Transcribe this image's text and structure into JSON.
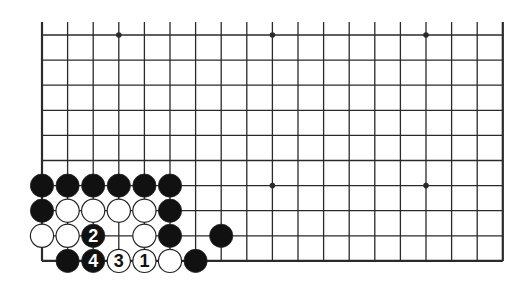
{
  "diagram": {
    "type": "go-board-section",
    "columns": 19,
    "visible_rows": 10,
    "open_top_edge": true,
    "grid": {
      "x0": 42,
      "dx": 25.6,
      "y0": 35,
      "dy": 25.1,
      "top_extend": 13
    },
    "hoshi": [
      [
        3,
        0
      ],
      [
        9,
        0
      ],
      [
        15,
        0
      ],
      [
        3,
        6
      ],
      [
        9,
        6
      ],
      [
        15,
        6
      ]
    ],
    "stones": [
      {
        "col": 0,
        "row": 6,
        "color": "black"
      },
      {
        "col": 1,
        "row": 6,
        "color": "black"
      },
      {
        "col": 2,
        "row": 6,
        "color": "black"
      },
      {
        "col": 3,
        "row": 6,
        "color": "black"
      },
      {
        "col": 4,
        "row": 6,
        "color": "black"
      },
      {
        "col": 5,
        "row": 6,
        "color": "black"
      },
      {
        "col": 0,
        "row": 7,
        "color": "black"
      },
      {
        "col": 1,
        "row": 7,
        "color": "white"
      },
      {
        "col": 2,
        "row": 7,
        "color": "white"
      },
      {
        "col": 3,
        "row": 7,
        "color": "white"
      },
      {
        "col": 4,
        "row": 7,
        "color": "white"
      },
      {
        "col": 5,
        "row": 7,
        "color": "black"
      },
      {
        "col": 0,
        "row": 8,
        "color": "white"
      },
      {
        "col": 1,
        "row": 8,
        "color": "white"
      },
      {
        "col": 2,
        "row": 8,
        "color": "black",
        "label": "2"
      },
      {
        "col": 4,
        "row": 8,
        "color": "white"
      },
      {
        "col": 5,
        "row": 8,
        "color": "black"
      },
      {
        "col": 7,
        "row": 8,
        "color": "black"
      },
      {
        "col": 1,
        "row": 9,
        "color": "black"
      },
      {
        "col": 2,
        "row": 9,
        "color": "black",
        "label": "4"
      },
      {
        "col": 3,
        "row": 9,
        "color": "white",
        "label": "3"
      },
      {
        "col": 4,
        "row": 9,
        "color": "white",
        "label": "1"
      },
      {
        "col": 5,
        "row": 9,
        "color": "white"
      },
      {
        "col": 6,
        "row": 9,
        "color": "black"
      }
    ],
    "colors": {
      "line": "#2a2a2a",
      "black_stone": "#111111",
      "white_stone": "#ffffff",
      "background": "#ffffff"
    }
  }
}
